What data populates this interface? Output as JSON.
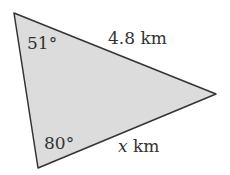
{
  "diagram": {
    "type": "triangle",
    "fill": "#dcdcdc",
    "stroke": "#333333",
    "vertices": {
      "top_left": [
        14,
        13
      ],
      "right": [
        216,
        94
      ],
      "bottom_left": [
        38,
        168
      ]
    },
    "angles": {
      "top_left": "51°",
      "bottom_left": "80°"
    },
    "sides": {
      "top": {
        "value": "4.8",
        "unit": "km"
      },
      "bottom": {
        "variable": "x",
        "unit": "km"
      }
    }
  }
}
